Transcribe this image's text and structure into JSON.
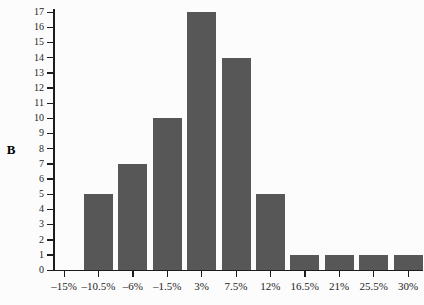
{
  "panel_label": "B",
  "colors": {
    "bar": "#575757",
    "axis": "#1c1c1c",
    "text": "#1c1c1c",
    "background": "#fcfcfc"
  },
  "chart_data": {
    "type": "bar",
    "categories": [
      "–15%",
      "–10.5%",
      "–6%",
      "–1.5%",
      "3%",
      "7.5%",
      "12%",
      "16.5%",
      "21%",
      "25.5%",
      "30%"
    ],
    "values": [
      0,
      5,
      7,
      10,
      17,
      14,
      5,
      1,
      1,
      1,
      1
    ],
    "title": "",
    "xlabel": "",
    "ylabel": "",
    "ylim": [
      0,
      17
    ],
    "ytick_step": 1,
    "grid": false,
    "legend": null
  }
}
